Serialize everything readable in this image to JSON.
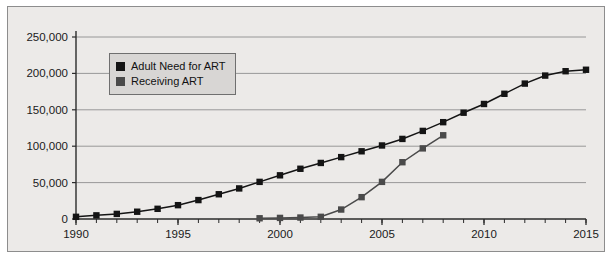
{
  "figure": {
    "background": "#eceae8",
    "border_color": "#8d8d8d",
    "page_background": "#ffffff"
  },
  "legend": {
    "position": "inside-top-left",
    "background": "#d8d6d4",
    "border_color": "#6f6f6f",
    "entries": [
      {
        "label": "Adult Need for ART",
        "color": "#141414"
      },
      {
        "label": "Receiving ART",
        "color": "#4a4a4a"
      }
    ]
  },
  "axes": {
    "y_ticks": [
      "0",
      "50,000",
      "100,000",
      "150,000",
      "200,000",
      "250,000"
    ],
    "x_ticks": [
      "1990",
      "1995",
      "2000",
      "2005",
      "2010",
      "2015"
    ],
    "x_tick_interval_years": 1,
    "grid": "horizontal-only",
    "grid_color": "#8f8f8f",
    "axis_color": "#2b2b2b"
  },
  "chart_data": {
    "type": "line",
    "title": "",
    "xlabel": "",
    "ylabel": "",
    "xlim": [
      1990,
      2015
    ],
    "ylim": [
      0,
      250000
    ],
    "grid": true,
    "legend_position": "upper left inside",
    "marker": "square",
    "series": [
      {
        "name": "Adult Need for ART",
        "color": "#141414",
        "x": [
          1990,
          1991,
          1992,
          1993,
          1994,
          1995,
          1996,
          1997,
          1998,
          1999,
          2000,
          2001,
          2002,
          2003,
          2004,
          2005,
          2006,
          2007,
          2008,
          2009,
          2010,
          2011,
          2012,
          2013,
          2014,
          2015
        ],
        "values": [
          3000,
          5000,
          7000,
          10000,
          14000,
          19000,
          26000,
          34000,
          42000,
          51000,
          60000,
          69000,
          77000,
          85000,
          93000,
          101000,
          110000,
          121000,
          133000,
          146000,
          158000,
          172000,
          186000,
          197000,
          203000,
          205000
        ]
      },
      {
        "name": "Receiving ART",
        "color": "#4a4a4a",
        "x": [
          1999,
          2000,
          2001,
          2002,
          2003,
          2004,
          2005,
          2006,
          2007,
          2008
        ],
        "values": [
          1000,
          1500,
          2000,
          3000,
          13000,
          30000,
          51000,
          78000,
          97000,
          115000
        ]
      }
    ]
  }
}
